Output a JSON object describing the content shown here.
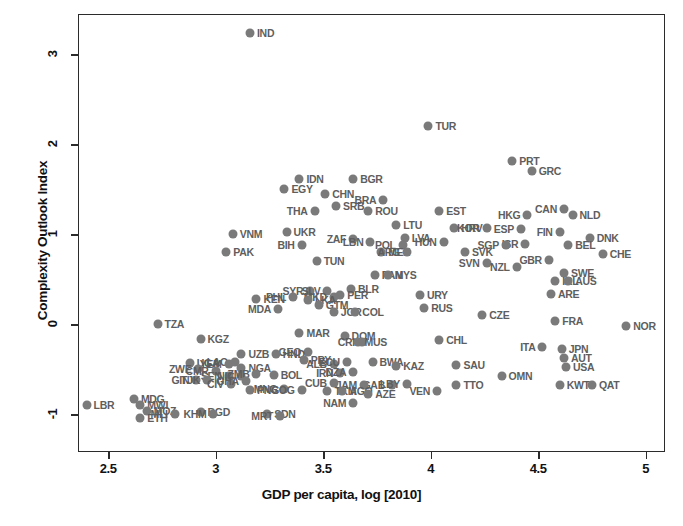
{
  "chart_data": {
    "type": "scatter",
    "title": "",
    "xlabel": "GDP per capita, log [2010]",
    "ylabel": "Complexity Outlook Index",
    "xlim": [
      2.36,
      5.09
    ],
    "ylim": [
      -1.42,
      3.45
    ],
    "xticks": [
      2.5,
      3,
      3.5,
      4,
      4.5,
      5
    ],
    "xtick_labels": [
      "2.5",
      "3",
      "3.5",
      "4",
      "4.5",
      "5"
    ],
    "yticks": [
      3,
      2,
      1,
      0,
      -1
    ],
    "ytick_labels": [
      "3",
      "2",
      "1",
      "0",
      "-1"
    ],
    "grid": false,
    "legend": null,
    "marker_color": "#7a7a7a",
    "label_color": "#5e5e5e",
    "axis_color": "#2b2b2b",
    "points": [
      {
        "code": "IND",
        "x": 3.16,
        "y": 3.24,
        "side": "right"
      },
      {
        "code": "TUR",
        "x": 3.99,
        "y": 2.21,
        "side": "right"
      },
      {
        "code": "PRT",
        "x": 4.38,
        "y": 1.82,
        "side": "right"
      },
      {
        "code": "GRC",
        "x": 4.47,
        "y": 1.7,
        "side": "right"
      },
      {
        "code": "IDN",
        "x": 3.39,
        "y": 1.61,
        "side": "right"
      },
      {
        "code": "BGR",
        "x": 3.64,
        "y": 1.62,
        "side": "right"
      },
      {
        "code": "EGY",
        "x": 3.32,
        "y": 1.5,
        "side": "right"
      },
      {
        "code": "CHN",
        "x": 3.51,
        "y": 1.45,
        "side": "right"
      },
      {
        "code": "SRB",
        "x": 3.56,
        "y": 1.32,
        "side": "right"
      },
      {
        "code": "BRA",
        "x": 3.78,
        "y": 1.38,
        "side": "left"
      },
      {
        "code": "THA",
        "x": 3.46,
        "y": 1.26,
        "side": "left"
      },
      {
        "code": "ROU",
        "x": 3.71,
        "y": 1.26,
        "side": "right"
      },
      {
        "code": "EST",
        "x": 4.04,
        "y": 1.26,
        "side": "right"
      },
      {
        "code": "HKG",
        "x": 4.45,
        "y": 1.22,
        "side": "left"
      },
      {
        "code": "CAN",
        "x": 4.62,
        "y": 1.28,
        "side": "left"
      },
      {
        "code": "NLD",
        "x": 4.66,
        "y": 1.21,
        "side": "right"
      },
      {
        "code": "UKR",
        "x": 3.33,
        "y": 1.03,
        "side": "right"
      },
      {
        "code": "LTU",
        "x": 3.84,
        "y": 1.1,
        "side": "right"
      },
      {
        "code": "HRV",
        "x": 4.11,
        "y": 1.07,
        "side": "right"
      },
      {
        "code": "KOR",
        "x": 4.26,
        "y": 1.07,
        "side": "left"
      },
      {
        "code": "ESP",
        "x": 4.42,
        "y": 1.06,
        "side": "left"
      },
      {
        "code": "FIN",
        "x": 4.6,
        "y": 1.03,
        "side": "left"
      },
      {
        "code": "ZAF",
        "x": 3.64,
        "y": 0.95,
        "side": "left"
      },
      {
        "code": "LBN",
        "x": 3.72,
        "y": 0.92,
        "side": "left"
      },
      {
        "code": "LVA",
        "x": 3.88,
        "y": 0.96,
        "side": "right"
      },
      {
        "code": "HUN",
        "x": 4.06,
        "y": 0.92,
        "side": "left"
      },
      {
        "code": "ISR",
        "x": 4.44,
        "y": 0.89,
        "side": "left"
      },
      {
        "code": "SGP",
        "x": 4.35,
        "y": 0.88,
        "side": "left"
      },
      {
        "code": "DNK",
        "x": 4.74,
        "y": 0.96,
        "side": "right"
      },
      {
        "code": "BEL",
        "x": 4.64,
        "y": 0.88,
        "side": "right"
      },
      {
        "code": "VNM",
        "x": 3.08,
        "y": 1.0,
        "side": "right"
      },
      {
        "code": "BIH",
        "x": 3.4,
        "y": 0.88,
        "side": "left"
      },
      {
        "code": "POL",
        "x": 3.87,
        "y": 0.88,
        "side": "left"
      },
      {
        "code": "MEX",
        "x": 3.77,
        "y": 0.8,
        "side": "right"
      },
      {
        "code": "ARG",
        "x": 3.89,
        "y": 0.8,
        "side": "left"
      },
      {
        "code": "SVK",
        "x": 4.16,
        "y": 0.8,
        "side": "right"
      },
      {
        "code": "CHE",
        "x": 4.8,
        "y": 0.78,
        "side": "right"
      },
      {
        "code": "GBR",
        "x": 4.55,
        "y": 0.72,
        "side": "left"
      },
      {
        "code": "PAK",
        "x": 3.05,
        "y": 0.8,
        "side": "right"
      },
      {
        "code": "TUN",
        "x": 3.47,
        "y": 0.7,
        "side": "right"
      },
      {
        "code": "SVN",
        "x": 4.26,
        "y": 0.68,
        "side": "left"
      },
      {
        "code": "NZL",
        "x": 4.4,
        "y": 0.64,
        "side": "left"
      },
      {
        "code": "SWE",
        "x": 4.62,
        "y": 0.57,
        "side": "right"
      },
      {
        "code": "PAN",
        "x": 3.74,
        "y": 0.55,
        "side": "right"
      },
      {
        "code": "MYS",
        "x": 3.8,
        "y": 0.55,
        "side": "right"
      },
      {
        "code": "IRL",
        "x": 4.58,
        "y": 0.48,
        "side": "right"
      },
      {
        "code": "AUS",
        "x": 4.64,
        "y": 0.48,
        "side": "right"
      },
      {
        "code": "SYR",
        "x": 3.44,
        "y": 0.37,
        "side": "left"
      },
      {
        "code": "SLV",
        "x": 3.52,
        "y": 0.37,
        "side": "left"
      },
      {
        "code": "BLR",
        "x": 3.63,
        "y": 0.39,
        "side": "right"
      },
      {
        "code": "PER",
        "x": 3.58,
        "y": 0.33,
        "side": "right"
      },
      {
        "code": "MKD",
        "x": 3.55,
        "y": 0.3,
        "side": "left"
      },
      {
        "code": "URY",
        "x": 3.95,
        "y": 0.33,
        "side": "right"
      },
      {
        "code": "ARE",
        "x": 4.56,
        "y": 0.34,
        "side": "right"
      },
      {
        "code": "KEN",
        "x": 3.19,
        "y": 0.28,
        "side": "right"
      },
      {
        "code": "PHL",
        "x": 3.36,
        "y": 0.3,
        "side": "left"
      },
      {
        "code": "LKA",
        "x": 3.43,
        "y": 0.27,
        "side": "right"
      },
      {
        "code": "GTM",
        "x": 3.48,
        "y": 0.21,
        "side": "right"
      },
      {
        "code": "MDA",
        "x": 3.29,
        "y": 0.17,
        "side": "left"
      },
      {
        "code": "JOR",
        "x": 3.55,
        "y": 0.14,
        "side": "right"
      },
      {
        "code": "COL",
        "x": 3.65,
        "y": 0.14,
        "side": "right"
      },
      {
        "code": "RUS",
        "x": 3.97,
        "y": 0.18,
        "side": "right"
      },
      {
        "code": "TZA",
        "x": 2.73,
        "y": 0.0,
        "side": "right"
      },
      {
        "code": "FRA",
        "x": 4.58,
        "y": 0.04,
        "side": "right"
      },
      {
        "code": "CZE",
        "x": 4.24,
        "y": 0.1,
        "side": "right"
      },
      {
        "code": "NOR",
        "x": 4.91,
        "y": -0.02,
        "side": "right"
      },
      {
        "code": "MAR",
        "x": 3.39,
        "y": -0.1,
        "side": "right"
      },
      {
        "code": "DOM",
        "x": 3.6,
        "y": -0.13,
        "side": "right"
      },
      {
        "code": "CRI",
        "x": 3.68,
        "y": -0.2,
        "side": "left"
      },
      {
        "code": "MUS",
        "x": 3.66,
        "y": -0.2,
        "side": "right"
      },
      {
        "code": "KGZ",
        "x": 2.93,
        "y": -0.16,
        "side": "right"
      },
      {
        "code": "CHL",
        "x": 4.04,
        "y": -0.18,
        "side": "right"
      },
      {
        "code": "ITA",
        "x": 4.52,
        "y": -0.25,
        "side": "left"
      },
      {
        "code": "JPN",
        "x": 4.61,
        "y": -0.27,
        "side": "right"
      },
      {
        "code": "GEO",
        "x": 3.43,
        "y": -0.31,
        "side": "left"
      },
      {
        "code": "UZB",
        "x": 3.12,
        "y": -0.33,
        "side": "right"
      },
      {
        "code": "HND",
        "x": 3.28,
        "y": -0.33,
        "side": "right"
      },
      {
        "code": "AUT",
        "x": 4.62,
        "y": -0.37,
        "side": "right"
      },
      {
        "code": "LAO",
        "x": 3.09,
        "y": -0.42,
        "side": "left"
      },
      {
        "code": "PRY",
        "x": 3.41,
        "y": -0.4,
        "side": "right"
      },
      {
        "code": "ALB",
        "x": 3.55,
        "y": -0.44,
        "side": "left"
      },
      {
        "code": "ECU",
        "x": 3.61,
        "y": -0.42,
        "side": "left"
      },
      {
        "code": "BWA",
        "x": 3.73,
        "y": -0.42,
        "side": "right"
      },
      {
        "code": "KAZ",
        "x": 3.84,
        "y": -0.46,
        "side": "right"
      },
      {
        "code": "SAU",
        "x": 4.12,
        "y": -0.45,
        "side": "right"
      },
      {
        "code": "USA",
        "x": 4.63,
        "y": -0.47,
        "side": "right"
      },
      {
        "code": "UGA",
        "x": 2.88,
        "y": -0.43,
        "side": "right"
      },
      {
        "code": "YEM",
        "x": 3.06,
        "y": -0.44,
        "side": "left"
      },
      {
        "code": "NGA",
        "x": 3.12,
        "y": -0.49,
        "side": "right"
      },
      {
        "code": "ZWE",
        "x": 2.92,
        "y": -0.5,
        "side": "left"
      },
      {
        "code": "CMR",
        "x": 3.0,
        "y": -0.52,
        "side": "left"
      },
      {
        "code": "SEN",
        "x": 3.06,
        "y": -0.57,
        "side": "left"
      },
      {
        "code": "NIC",
        "x": 3.12,
        "y": -0.57,
        "side": "left"
      },
      {
        "code": "ZMB",
        "x": 3.19,
        "y": -0.55,
        "side": "left"
      },
      {
        "code": "BOL",
        "x": 3.27,
        "y": -0.56,
        "side": "right"
      },
      {
        "code": "IRN",
        "x": 3.58,
        "y": -0.54,
        "side": "left"
      },
      {
        "code": "DZA",
        "x": 3.64,
        "y": -0.53,
        "side": "left"
      },
      {
        "code": "OMN",
        "x": 4.33,
        "y": -0.57,
        "side": "right"
      },
      {
        "code": "GIN",
        "x": 2.91,
        "y": -0.62,
        "side": "left"
      },
      {
        "code": "TJK",
        "x": 2.96,
        "y": -0.62,
        "side": "left"
      },
      {
        "code": "CIV",
        "x": 3.07,
        "y": -0.66,
        "side": "left"
      },
      {
        "code": "GHA",
        "x": 3.14,
        "y": -0.63,
        "side": "left"
      },
      {
        "code": "CUB",
        "x": 3.55,
        "y": -0.65,
        "side": "left"
      },
      {
        "code": "GAB",
        "x": 3.82,
        "y": -0.67,
        "side": "left"
      },
      {
        "code": "LBY",
        "x": 3.89,
        "y": -0.66,
        "side": "left"
      },
      {
        "code": "JAM",
        "x": 3.69,
        "y": -0.67,
        "side": "left"
      },
      {
        "code": "TTO",
        "x": 4.12,
        "y": -0.68,
        "side": "right"
      },
      {
        "code": "KWT",
        "x": 4.6,
        "y": -0.68,
        "side": "right"
      },
      {
        "code": "QAT",
        "x": 4.75,
        "y": -0.68,
        "side": "right"
      },
      {
        "code": "MNG",
        "x": 3.32,
        "y": -0.72,
        "side": "left"
      },
      {
        "code": "COG",
        "x": 3.4,
        "y": -0.73,
        "side": "left"
      },
      {
        "code": "PNG",
        "x": 3.16,
        "y": -0.73,
        "side": "right"
      },
      {
        "code": "TKM",
        "x": 3.52,
        "y": -0.74,
        "side": "right"
      },
      {
        "code": "AGO",
        "x": 3.59,
        "y": -0.74,
        "side": "right"
      },
      {
        "code": "VEN",
        "x": 4.03,
        "y": -0.74,
        "side": "left"
      },
      {
        "code": "AZE",
        "x": 3.71,
        "y": -0.78,
        "side": "right"
      },
      {
        "code": "LBR",
        "x": 2.4,
        "y": -0.9,
        "side": "right"
      },
      {
        "code": "MDG",
        "x": 2.62,
        "y": -0.83,
        "side": "right"
      },
      {
        "code": "MWI",
        "x": 2.65,
        "y": -0.9,
        "side": "right"
      },
      {
        "code": "MOZ",
        "x": 2.68,
        "y": -0.96,
        "side": "right"
      },
      {
        "code": "ETH",
        "x": 2.65,
        "y": -1.04,
        "side": "right"
      },
      {
        "code": "MLI",
        "x": 2.81,
        "y": -1.0,
        "side": "left"
      },
      {
        "code": "BGD",
        "x": 2.93,
        "y": -0.98,
        "side": "right"
      },
      {
        "code": "KHM",
        "x": 2.99,
        "y": -1.0,
        "side": "left"
      },
      {
        "code": "SDN",
        "x": 3.24,
        "y": -1.0,
        "side": "right"
      },
      {
        "code": "MRT",
        "x": 3.3,
        "y": -1.02,
        "side": "left"
      },
      {
        "code": "NAM",
        "x": 3.64,
        "y": -0.88,
        "side": "left"
      }
    ]
  },
  "axes": {
    "x_label": "GDP per capita, log [2010]",
    "y_label": "Complexity Outlook Index"
  }
}
